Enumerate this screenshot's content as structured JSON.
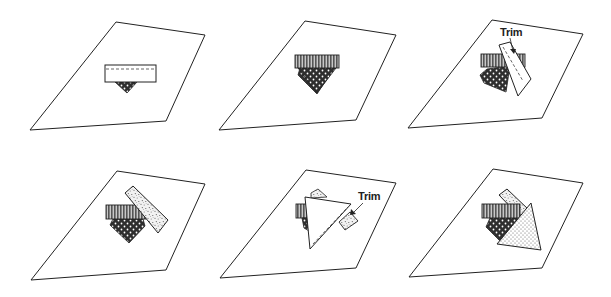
{
  "figure": {
    "colors": {
      "outline": "#222222",
      "background": "#ffffff",
      "stripe_dark": "#555555",
      "stripe_light": "#bbbbbb",
      "dark_fabric": "#333333",
      "speckle_bg": "#eeeeee"
    },
    "panels": [
      {
        "step": 1,
        "label": ""
      },
      {
        "step": 2,
        "label": ""
      },
      {
        "step": 3,
        "label": "Trim"
      },
      {
        "step": 4,
        "label": ""
      },
      {
        "step": 5,
        "label": "Trim"
      },
      {
        "step": 6,
        "label": ""
      }
    ]
  }
}
